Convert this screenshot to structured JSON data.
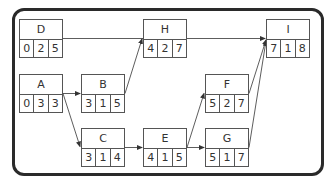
{
  "diagram": {
    "type": "activity-on-node network",
    "nodes": [
      {
        "id": "D",
        "label": "D",
        "values": [
          "0",
          "2",
          "5"
        ],
        "x": 19,
        "y": 19
      },
      {
        "id": "A",
        "label": "A",
        "values": [
          "0",
          "3",
          "3"
        ],
        "x": 19,
        "y": 74
      },
      {
        "id": "B",
        "label": "B",
        "values": [
          "3",
          "1",
          "5"
        ],
        "x": 81,
        "y": 74
      },
      {
        "id": "C",
        "label": "C",
        "values": [
          "3",
          "1",
          "4"
        ],
        "x": 81,
        "y": 128
      },
      {
        "id": "H",
        "label": "H",
        "values": [
          "4",
          "2",
          "7"
        ],
        "x": 143,
        "y": 19
      },
      {
        "id": "E",
        "label": "E",
        "values": [
          "4",
          "1",
          "5"
        ],
        "x": 143,
        "y": 128
      },
      {
        "id": "F",
        "label": "F",
        "values": [
          "5",
          "2",
          "7"
        ],
        "x": 205,
        "y": 74
      },
      {
        "id": "G",
        "label": "G",
        "values": [
          "5",
          "1",
          "7"
        ],
        "x": 205,
        "y": 128
      },
      {
        "id": "I",
        "label": "I",
        "values": [
          "7",
          "1",
          "8"
        ],
        "x": 266,
        "y": 19
      }
    ],
    "edges": [
      {
        "from": "D",
        "to": "I"
      },
      {
        "from": "A",
        "to": "B"
      },
      {
        "from": "A",
        "to": "C"
      },
      {
        "from": "B",
        "to": "H"
      },
      {
        "from": "C",
        "to": "E"
      },
      {
        "from": "E",
        "to": "F"
      },
      {
        "from": "E",
        "to": "G"
      },
      {
        "from": "F",
        "to": "I"
      },
      {
        "from": "G",
        "to": "I"
      }
    ],
    "colors": {
      "frame": "#2a2a2a",
      "box": "#555555",
      "text": "#333333",
      "arrow": "#333333"
    }
  }
}
